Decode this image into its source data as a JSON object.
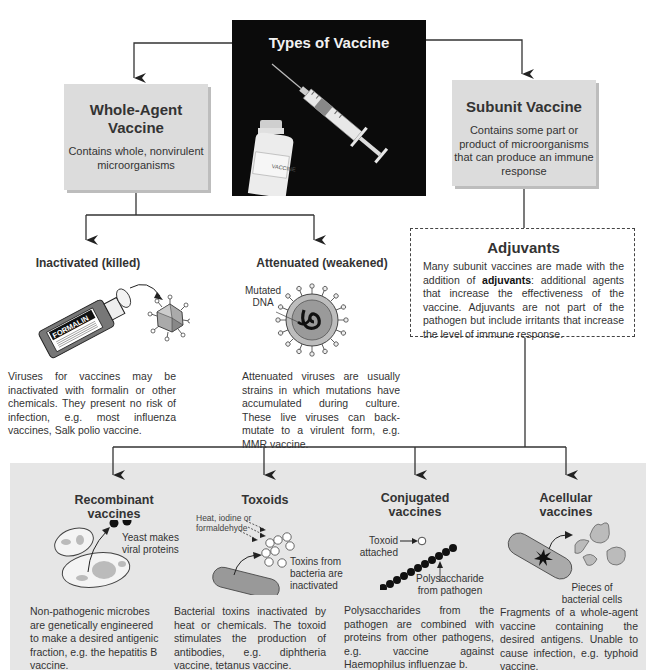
{
  "title": "Types of Vaccine",
  "hero": {
    "vial_label": "VACCINE"
  },
  "whole_agent": {
    "title_line1": "Whole-Agent",
    "title_line2": "Vaccine",
    "description_line1": "Contains whole, nonvirulent",
    "description_line2": "microorganisms"
  },
  "subunit": {
    "title": "Subunit Vaccine",
    "description_line1": "Contains some part or",
    "description_line2": "product of microorganisms",
    "description_line3": "that can produce an immune",
    "description_line4": "response"
  },
  "inactivated": {
    "title": "Inactivated (killed)",
    "bottle_label": "FORMALIN",
    "text": "Viruses for vaccines may be inactivated with formalin or other chemicals. They present no risk of infection, e.g. most influenza vaccines, Salk polio vaccine."
  },
  "attenuated": {
    "title": "Attenuated (weakened)",
    "label_line1": "Mutated",
    "label_line2": "DNA",
    "text": "Attenuated viruses are usually strains in which mutations have accumulated during culture. These live viruses can back-mutate to a virulent form, e.g. MMR vaccine."
  },
  "adjuvants": {
    "title": "Adjuvants",
    "text_before": "Many subunit vaccines are made with the addition of ",
    "bold_term": "adjuvants",
    "text_after": ": additional agents that increase the effectiveness of the vaccine. Adjuvants are not part of the pathogen but include irritants that increase the level of immune response."
  },
  "recombinant": {
    "title_line1": "Recombinant",
    "title_line2": "vaccines",
    "label_line1": "Yeast makes",
    "label_line2": "viral proteins",
    "text": "Non-pathogenic microbes are genetically engineered to make a desired antigenic fraction, e.g. the hepatitis B vaccine."
  },
  "toxoids": {
    "title": "Toxoids",
    "label_heat_line1": "Heat, iodine or",
    "label_heat_line2": "formaldehyde",
    "label_toxins_line1": "Toxins from",
    "label_toxins_line2": "bacteria are",
    "label_toxins_line3": "inactivated",
    "text": "Bacterial toxins inactivated by heat or chemicals. The toxoid stimulates the production of antibodies, e.g. diphtheria vaccine, tetanus vaccine."
  },
  "conjugated": {
    "title_line1": "Conjugated",
    "title_line2": "vaccines",
    "label_toxoid_line1": "Toxoid",
    "label_toxoid_line2": "attached",
    "label_poly_line1": "Polysaccharide",
    "label_poly_line2": "from pathogen",
    "text": "Polysaccharides from the pathogen are combined with proteins from other pathogens, e.g. vaccine against Haemophilus influenzae b."
  },
  "acellular": {
    "title_line1": "Acellular",
    "title_line2": "vaccines",
    "label_line1": "Pieces of",
    "label_line2": "bacterial cells",
    "text": "Fragments of a whole-agent vaccine containing the desired antigens. Unable to cause infection, e.g. typhoid vaccine."
  },
  "colors": {
    "box_gray": "#dcdcdc",
    "panel_gray": "#e6e6e6",
    "hero_bg": "#0b0b0b",
    "line": "#333333"
  }
}
